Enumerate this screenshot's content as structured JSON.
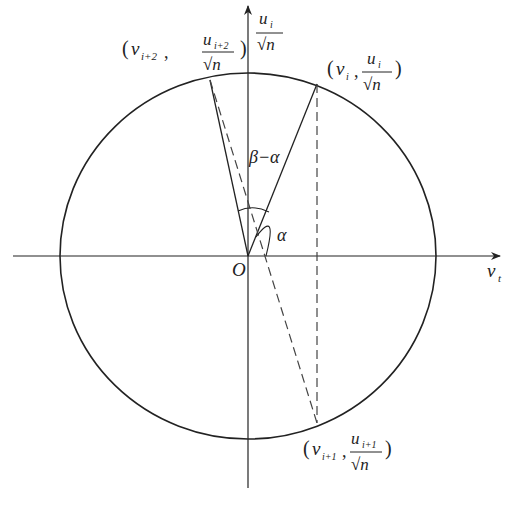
{
  "diagram": {
    "type": "unit-circle-geometry",
    "origin_label": "O",
    "axes": {
      "horizontal": {
        "label_main": "v",
        "label_sub": "t"
      },
      "vertical": {
        "label_num": "u",
        "label_num_sub": "i",
        "label_den": "√n"
      }
    },
    "points": [
      {
        "id": "p_i",
        "v_label": "v",
        "v_sub": "i",
        "u_label": "u",
        "u_sub": "i",
        "den": "√n",
        "open": "(",
        "comma": ",",
        "close": ")"
      },
      {
        "id": "p_i_plus_2",
        "v_label": "v",
        "v_sub": "i+2",
        "u_label": "u",
        "u_sub": "i+2",
        "den": "√n",
        "open": "(",
        "comma": ",",
        "close": ")"
      },
      {
        "id": "p_i_plus_1",
        "v_label": "v",
        "v_sub": "i+1",
        "u_label": "u",
        "u_sub": "i+1",
        "den": "√n",
        "open": "(",
        "comma": ",",
        "close": ")"
      }
    ],
    "angles": {
      "beta_minus_alpha": "β−α",
      "alpha": "α"
    },
    "colors": {
      "stroke": "#222222",
      "dashed": "#444444",
      "background": "#ffffff"
    }
  }
}
